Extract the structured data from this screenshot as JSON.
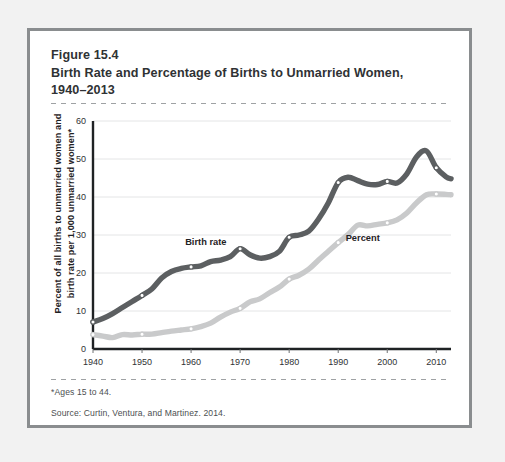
{
  "figure": {
    "number": "Figure 15.4",
    "title_line1": "Birth Rate and Percentage of Births to Unmarried Women,",
    "title_line2": "1940–2013",
    "footnote": "*Ages 15 to 44.",
    "source": "Source: Curtin, Ventura, and Martinez. 2014."
  },
  "colors": {
    "birth_rate": "#5c5f61",
    "percent": "#c9cacb",
    "frame": "#8a8d8f",
    "grid": "#e4e5e6",
    "axis": "#1f2224",
    "page_bg": "#f2f2f2",
    "card_bg": "#ffffff"
  },
  "chart_data": {
    "type": "line",
    "title": "Birth Rate and Percentage of Births to Unmarried Women, 1940–2013",
    "xlabel": "",
    "ylabel": "Percent of all births to unmarried women and birth rate per 1,000 unmarried women*",
    "xlim": [
      1940,
      2013
    ],
    "ylim": [
      0,
      60
    ],
    "yticks": [
      0,
      10,
      20,
      30,
      40,
      50,
      60
    ],
    "xticks": [
      1940,
      1950,
      1960,
      1970,
      1980,
      1990,
      2000,
      2010
    ],
    "grid": "horizontal",
    "legend": "inline-labels",
    "annotations": [
      {
        "text": "Birth rate",
        "x": 1963,
        "y": 27.5
      },
      {
        "text": "Percent",
        "x": 1995,
        "y": 28.5
      }
    ],
    "series": [
      {
        "name": "Birth rate",
        "label": "Birth rate",
        "color": "#5c5f61",
        "unit": "births per 1,000 unmarried women aged 15-44",
        "x": [
          1940,
          1942,
          1944,
          1946,
          1948,
          1950,
          1952,
          1954,
          1956,
          1958,
          1960,
          1962,
          1964,
          1966,
          1968,
          1970,
          1972,
          1974,
          1976,
          1978,
          1980,
          1982,
          1984,
          1986,
          1988,
          1990,
          1992,
          1994,
          1996,
          1998,
          2000,
          2002,
          2004,
          2006,
          2008,
          2010,
          2012,
          2013
        ],
        "values": [
          7.1,
          8.0,
          9.3,
          10.9,
          12.5,
          14.1,
          15.8,
          18.7,
          20.4,
          21.2,
          21.6,
          21.9,
          23.0,
          23.4,
          24.3,
          26.4,
          24.8,
          23.9,
          24.3,
          25.7,
          29.4,
          30.0,
          31.0,
          34.2,
          38.5,
          43.8,
          45.2,
          44.3,
          43.4,
          43.3,
          44.1,
          43.7,
          46.1,
          50.6,
          52.1,
          47.7,
          45.3,
          44.8
        ]
      },
      {
        "name": "Percent",
        "label": "Percent",
        "color": "#c9cacb",
        "unit": "percent of all births to unmarried women",
        "x": [
          1940,
          1942,
          1944,
          1946,
          1948,
          1950,
          1952,
          1954,
          1956,
          1958,
          1960,
          1962,
          1964,
          1966,
          1968,
          1970,
          1972,
          1974,
          1976,
          1978,
          1980,
          1982,
          1984,
          1986,
          1988,
          1990,
          1992,
          1994,
          1996,
          1998,
          2000,
          2002,
          2004,
          2006,
          2008,
          2010,
          2012,
          2013
        ],
        "values": [
          3.8,
          3.4,
          3.0,
          3.8,
          3.7,
          3.9,
          3.9,
          4.3,
          4.7,
          5.0,
          5.3,
          5.9,
          6.8,
          8.4,
          9.7,
          10.7,
          12.4,
          13.2,
          14.8,
          16.3,
          18.4,
          19.4,
          21.0,
          23.4,
          25.7,
          28.0,
          30.1,
          32.6,
          32.4,
          32.8,
          33.2,
          34.0,
          35.8,
          38.5,
          40.6,
          40.8,
          40.7,
          40.6
        ]
      }
    ],
    "markers": {
      "shape": "circle-open",
      "at_x": [
        1940,
        1950,
        1960,
        1970,
        1980,
        1990,
        2000,
        2010
      ]
    }
  }
}
